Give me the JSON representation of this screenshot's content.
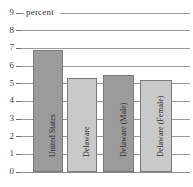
{
  "chart_data": {
    "type": "bar",
    "title": "",
    "xlabel": "",
    "ylabel": "percent",
    "ylim": [
      0,
      9
    ],
    "grid": true,
    "legend": "none",
    "categories": [
      "United States",
      "Delaware",
      "Delaware (Male)",
      "Delaware (Female)"
    ],
    "values": [
      6.9,
      5.3,
      5.5,
      5.2
    ],
    "ticks": [
      "9",
      "8",
      "7",
      "6",
      "5",
      "4",
      "3",
      "2",
      "1",
      "0"
    ],
    "bar_colors": [
      "#9b9b9b",
      "#c9c9c9",
      "#9b9b9b",
      "#c9c9c9"
    ],
    "axis_color": "#8a8a8a",
    "text_color": "#2f2f2f"
  },
  "axis": {
    "unit_label": "percent"
  },
  "bars": [
    {
      "label": "United States",
      "value": 6.9
    },
    {
      "label": "Delaware",
      "value": 5.3
    },
    {
      "label": "Delaware (Male)",
      "value": 5.5
    },
    {
      "label": "Delaware (Female)",
      "value": 5.2
    }
  ],
  "title_sliver": ""
}
